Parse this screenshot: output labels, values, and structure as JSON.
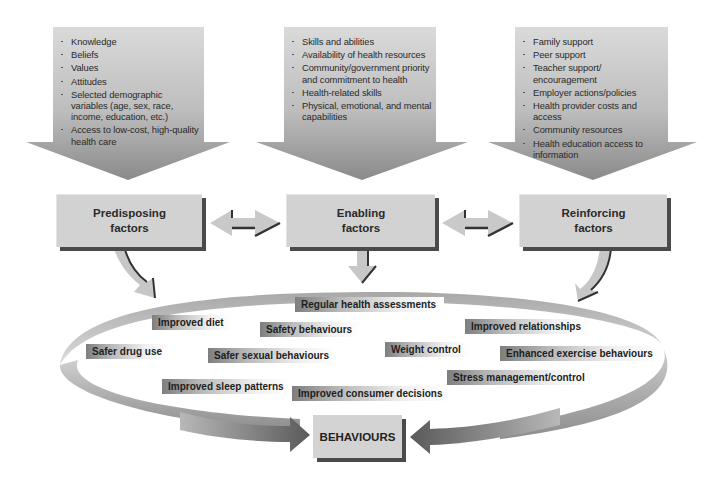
{
  "diagram": {
    "type": "precede-proceed-factors-flow",
    "columns": [
      {
        "id": "predisposing",
        "factor_label_line1": "Predisposing",
        "factor_label_line2": "factors",
        "items": [
          "Knowledge",
          "Beliefs",
          "Values",
          "Attitudes",
          "Selected demographic variables (age, sex, race, income, education, etc.)",
          "Access to low-cost, high-quality health care"
        ]
      },
      {
        "id": "enabling",
        "factor_label_line1": "Enabling",
        "factor_label_line2": "factors",
        "items": [
          "Skills and abilities",
          "Availability of health resources",
          "Community/government priority and commitment to health",
          "Health-related skills",
          "Physical, emotional, and mental capabilities"
        ]
      },
      {
        "id": "reinforcing",
        "factor_label_line1": "Reinforcing",
        "factor_label_line2": "factors",
        "items": [
          "Family support",
          "Peer support",
          "Teacher support/ encouragement",
          "Employer actions/policies",
          "Health provider costs and access",
          "Community resources",
          "Health education access to information"
        ]
      }
    ],
    "behaviour_tags": [
      "Regular health assessments",
      "Improved diet",
      "Safety behaviours",
      "Improved relationships",
      "Safer drug use",
      "Safer sexual behaviours",
      "Weight control",
      "Enhanced exercise behaviours",
      "Improved sleep patterns",
      "Improved consumer decisions",
      "Stress management/control"
    ],
    "outcome_label": "BEHAVIOURS",
    "connectors": {
      "predisposing_enabling": "bidirectional-arrow",
      "enabling_reinforcing": "bidirectional-arrow",
      "factors_to_ring": "curved-down-arrows",
      "ring_to_behaviours": "converging-arrows"
    }
  }
}
